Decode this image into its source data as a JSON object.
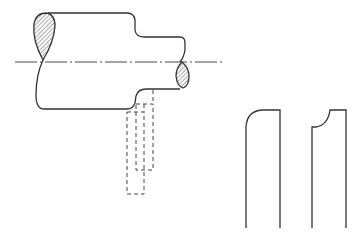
{
  "figure": {
    "title": "",
    "colors": {
      "background": "#ffffff",
      "line": "#333333",
      "hatch": "#555555"
    }
  },
  "elements": {
    "shaft": {
      "label": ""
    },
    "centerline": {
      "label": ""
    },
    "tool_outline_dashed": {
      "label": ""
    },
    "tool_profile_rounded": {
      "label": ""
    },
    "tool_profile_concave": {
      "label": ""
    }
  }
}
